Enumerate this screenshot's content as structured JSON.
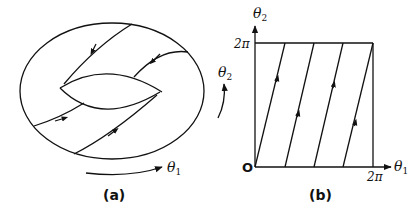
{
  "figure": {
    "panel_a": {
      "caption": "(a)",
      "theta1_label": "θ1",
      "theta2_label": "θ2",
      "description": "Torus with trajectory winding around it"
    },
    "panel_b": {
      "caption": "(b)",
      "x_axis_label": "θ1",
      "y_axis_label": "θ2",
      "origin_label": "O",
      "x_tick_label": "2π",
      "y_tick_label": "2π",
      "description": "Unit square [0,2π]×[0,2π] with parallel trajectory segments"
    },
    "colors": {
      "stroke": "#111111",
      "background": "#ffffff"
    }
  }
}
